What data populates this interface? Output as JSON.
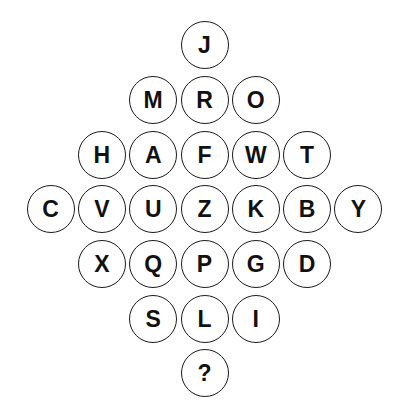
{
  "puzzle": {
    "rows": [
      [
        "J"
      ],
      [
        "M",
        "R",
        "O"
      ],
      [
        "H",
        "A",
        "F",
        "W",
        "T"
      ],
      [
        "C",
        "V",
        "U",
        "Z",
        "K",
        "B",
        "Y"
      ],
      [
        "X",
        "Q",
        "P",
        "G",
        "D"
      ],
      [
        "S",
        "L",
        "I"
      ],
      [
        "?"
      ]
    ],
    "colors": {
      "background": "#ffffff",
      "circle_stroke": "#1a1a1a",
      "text": "#111111"
    }
  }
}
